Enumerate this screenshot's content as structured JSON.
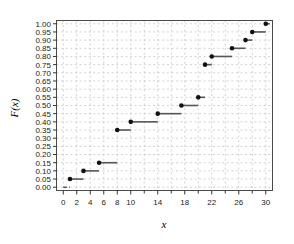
{
  "chart_data": {
    "type": "line",
    "subtype": "step-ecdf",
    "title": "",
    "xlabel": "x",
    "ylabel": "F(x)",
    "xlim": [
      -1,
      31
    ],
    "ylim": [
      -0.02,
      1.02
    ],
    "grid": true,
    "grid_style": "dashed",
    "grid_color": "#bfbfbf",
    "legend": "none",
    "marker": "filled-circle",
    "marker_color": "#111111",
    "line_color": "#555555",
    "xticks": [
      0,
      2,
      4,
      6,
      8,
      10,
      14,
      18,
      22,
      26,
      30
    ],
    "xtick_labels": [
      "0",
      "2",
      "4",
      "6",
      "8",
      "10",
      "14",
      "18",
      "22",
      "26",
      "30"
    ],
    "xtick_minor": [
      12,
      16,
      20,
      24,
      28
    ],
    "yticks": [
      0.0,
      0.05,
      0.1,
      0.15,
      0.2,
      0.25,
      0.3,
      0.35,
      0.4,
      0.45,
      0.5,
      0.55,
      0.6,
      0.65,
      0.7,
      0.75,
      0.8,
      0.85,
      0.9,
      0.95,
      1.0
    ],
    "ytick_labels": [
      "0.00",
      "0.05",
      "0.10",
      "0.15",
      "0.20",
      "0.25",
      "0.30",
      "0.35",
      "0.40",
      "0.45",
      "0.50",
      "0.55",
      "0.60",
      "0.65",
      "0.70",
      "0.75",
      "0.80",
      "0.85",
      "0.90",
      "0.95",
      "1.00"
    ],
    "x": [
      0,
      1,
      3,
      5.3,
      8,
      10,
      14,
      17.5,
      20,
      21,
      22,
      25,
      27,
      28,
      30
    ],
    "y": [
      0.0,
      0.05,
      0.1,
      0.15,
      0.35,
      0.4,
      0.45,
      0.5,
      0.55,
      0.75,
      0.8,
      0.85,
      0.9,
      0.95,
      1.0
    ],
    "steps": [
      {
        "x": 0,
        "y": 0.0,
        "x_end": 1,
        "point": false
      },
      {
        "x": 1,
        "y": 0.05,
        "x_end": 3,
        "point": true
      },
      {
        "x": 3,
        "y": 0.1,
        "x_end": 5.3,
        "point": true
      },
      {
        "x": 5.3,
        "y": 0.15,
        "x_end": 8,
        "point": true
      },
      {
        "x": 8,
        "y": 0.35,
        "x_end": 10,
        "point": true
      },
      {
        "x": 10,
        "y": 0.4,
        "x_end": 14,
        "point": true
      },
      {
        "x": 14,
        "y": 0.45,
        "x_end": 17.5,
        "point": true
      },
      {
        "x": 17.5,
        "y": 0.5,
        "x_end": 20,
        "point": true
      },
      {
        "x": 20,
        "y": 0.55,
        "x_end": 21,
        "point": true
      },
      {
        "x": 21,
        "y": 0.75,
        "x_end": 22,
        "point": true
      },
      {
        "x": 22,
        "y": 0.8,
        "x_end": 25,
        "point": true
      },
      {
        "x": 25,
        "y": 0.85,
        "x_end": 27,
        "point": true
      },
      {
        "x": 27,
        "y": 0.9,
        "x_end": 28,
        "point": true
      },
      {
        "x": 28,
        "y": 0.95,
        "x_end": 30,
        "point": true
      },
      {
        "x": 30,
        "y": 1.0,
        "x_end": 30.6,
        "point": true
      }
    ]
  }
}
